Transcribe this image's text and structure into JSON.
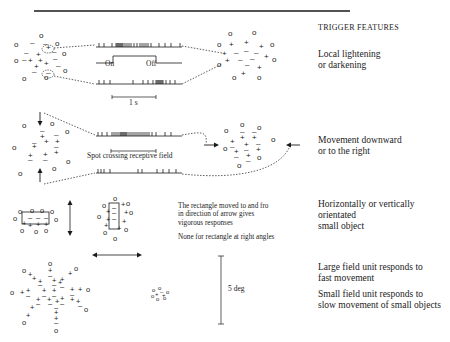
{
  "header": {
    "title": "TRIGGER FEATURES"
  },
  "rows": [
    {
      "id": "lightening",
      "feature": [
        "Local lightening",
        "or darkening"
      ],
      "stimulus_labels": {
        "on": "On",
        "off": "Off",
        "scale": "1 s"
      }
    },
    {
      "id": "movement",
      "feature": [
        "Movement downward",
        "or to the right"
      ],
      "stimulus_labels": {
        "bar": "Spot crossing receptive field"
      }
    },
    {
      "id": "orientation",
      "feature": [
        "Horizontally or vertically",
        "orientated",
        "small object"
      ],
      "notes": [
        "The rectangle moved to and fro",
        "in direction of arrow gives",
        "vigorous responses",
        "None for rectangle at right angles"
      ]
    },
    {
      "id": "field-size",
      "feature_large": [
        "Large field unit responds to",
        "fast movement"
      ],
      "feature_small": [
        "Small field unit responds to",
        "slow movement of small objects"
      ],
      "scale": "5 deg"
    }
  ],
  "colors": {
    "ink": "#1a1a1a",
    "background": "#ffffff"
  }
}
